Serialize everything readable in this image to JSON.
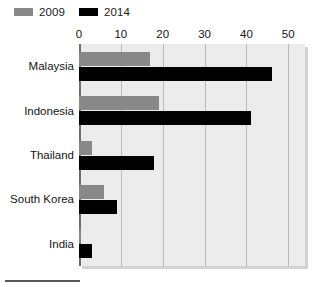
{
  "legend": {
    "position": "top-left",
    "entries": [
      {
        "label": "2009",
        "color": "#888888",
        "swatch_name": "legend-swatch-2009"
      },
      {
        "label": "2014",
        "color": "#000000",
        "swatch_name": "legend-swatch-2014"
      }
    ]
  },
  "axis": {
    "x_ticks": [
      "0",
      "10",
      "20",
      "30",
      "40",
      "50"
    ],
    "x_min": 0,
    "x_max": 54,
    "grid": true
  },
  "categories": [
    "Malaysia",
    "Indonesia",
    "Thailand",
    "South Korea",
    "India"
  ],
  "colors": {
    "panel_background": "#ebebeb",
    "panel_shadow": "#d2d2d2",
    "gridline": "#b9b9b9",
    "zero_axis": "#6e6e6e",
    "series_2009": "#888888",
    "series_2014": "#000000",
    "text": "#141414"
  },
  "chart_data": {
    "type": "bar",
    "orientation": "horizontal",
    "title": "",
    "subtitle": "",
    "xlabel": "",
    "ylabel": "",
    "categories": [
      "Malaysia",
      "Indonesia",
      "Thailand",
      "South Korea",
      "India"
    ],
    "series": [
      {
        "name": "2009",
        "color": "#888888",
        "values": [
          17,
          19,
          3,
          6,
          0.5
        ]
      },
      {
        "name": "2014",
        "color": "#000000",
        "values": [
          46,
          41,
          18,
          9,
          3
        ]
      }
    ],
    "xlim": [
      0,
      54
    ],
    "xticks": [
      0,
      10,
      20,
      30,
      40,
      50
    ],
    "grid": true,
    "legend_position": "top-left"
  }
}
